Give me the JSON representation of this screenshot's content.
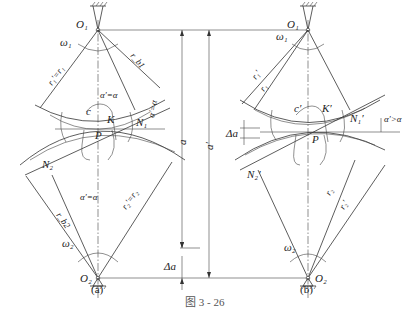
{
  "figure": {
    "caption": "图 3 - 26",
    "panel_a": {
      "label": "(a)",
      "O1": "O₁",
      "O2": "O₂",
      "omega1": "ω₁",
      "omega2": "ω₂",
      "r1_eq": "r₁′=r₁",
      "r2_eq": "r₂′=r₂",
      "rb1": "r_b1",
      "rb2": "r_b2",
      "alpha_top": "α′=α",
      "alpha_side": "α′=α",
      "alpha_bottom": "α′=α",
      "c": "c",
      "K": "K",
      "P": "P",
      "N1": "N₁",
      "N2": "N₂"
    },
    "panel_b": {
      "label": "(b)",
      "O1": "O₁",
      "O2": "O₂",
      "omega1": "ω₁",
      "omega2": "ω₂",
      "r1p": "r₁′",
      "r1": "r₁",
      "r2": "r₂",
      "r2p": "r₂′",
      "alpha_side": "α′>α",
      "delta_a": "Δa",
      "c": "c′",
      "K": "K′",
      "P": "P",
      "N1": "N₁′",
      "N2": "N₂′"
    },
    "dimensions": {
      "a": "a",
      "a_prime": "a′",
      "delta_a": "Δa"
    }
  }
}
